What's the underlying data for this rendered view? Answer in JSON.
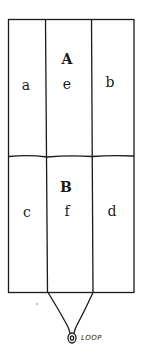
{
  "diagram": {
    "sections": [
      {
        "id": "A",
        "label": "A",
        "cells": [
          {
            "label": "a"
          },
          {
            "label": "e"
          },
          {
            "label": "b"
          }
        ]
      },
      {
        "id": "B",
        "label": "B",
        "cells": [
          {
            "label": "c"
          },
          {
            "label": "f"
          },
          {
            "label": "d"
          }
        ]
      }
    ],
    "loop_label": "LOOP",
    "colors": {
      "line": "#1a1a1a",
      "background": "#ffffff"
    }
  }
}
